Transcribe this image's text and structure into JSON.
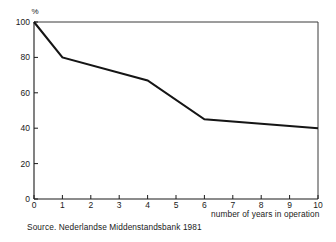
{
  "chart_data": {
    "type": "line",
    "title": "",
    "subtitle": "",
    "xlabel": "number of years in operation",
    "ylabel": "%",
    "x": [
      0,
      1,
      4,
      6,
      10
    ],
    "values": [
      100,
      80,
      67,
      45,
      40
    ],
    "series": [
      {
        "name": "surviving businesses",
        "x": [
          0,
          1,
          4,
          6,
          10
        ],
        "values": [
          100,
          80,
          67,
          45,
          40
        ]
      }
    ],
    "xlim": [
      0,
      10
    ],
    "ylim": [
      0,
      100
    ],
    "xticks": [
      "0",
      "1",
      "2",
      "3",
      "4",
      "5",
      "6",
      "7",
      "8",
      "9",
      "10"
    ],
    "xtick_values": [
      0,
      1,
      2,
      3,
      4,
      5,
      6,
      7,
      8,
      9,
      10
    ],
    "yticks": [
      "0",
      "20",
      "40",
      "60",
      "80",
      "100"
    ],
    "ytick_values": [
      0,
      20,
      40,
      60,
      80,
      100
    ],
    "grid": false,
    "legend": "none",
    "line_color": "#151515",
    "axis_color": "#1a1a1a",
    "background_color": "#ffffff",
    "annotations": []
  },
  "axes": {
    "y_unit_label": "%",
    "x_title": "number of years in operation"
  },
  "footer": {
    "source_note": "Source. Nederlandse Middenstandsbank 1981"
  }
}
